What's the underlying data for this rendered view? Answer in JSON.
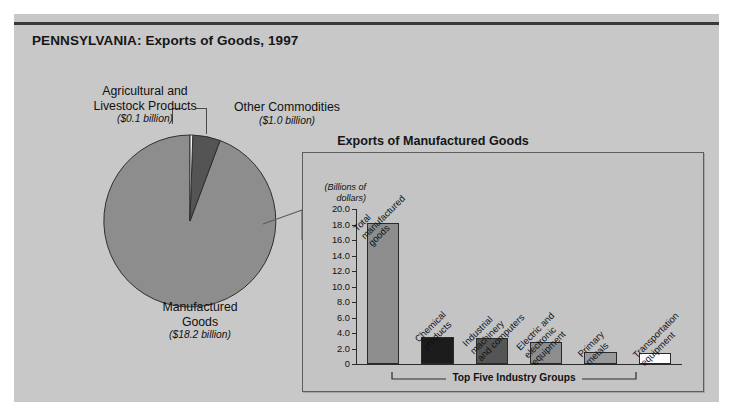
{
  "title": "PENNSYLVANIA: Exports of Goods, 1997",
  "pie_labels": {
    "agricultural": {
      "line1": "Agricultural and",
      "line2": "Livestock Products",
      "amount": "($0.1 billion)"
    },
    "other": {
      "line1": "Other Commodities",
      "line2": "",
      "amount": "($1.0 billion)"
    },
    "manufactured": {
      "line1": "Manufactured",
      "line2": "Goods",
      "amount": "($18.2 billion)"
    }
  },
  "panel": {
    "title": "Exports of Manufactured Goods",
    "axis_caption_line1": "(Billions of",
    "axis_caption_line2": "dollars)",
    "bracket_label": "Top Five Industry Groups"
  },
  "chart_data": [
    {
      "type": "pie",
      "title": "PENNSYLVANIA: Exports of Goods, 1997",
      "unit": "billions of dollars",
      "labels": [
        "Manufactured Goods",
        "Other Commodities",
        "Agricultural and Livestock Products"
      ],
      "values": [
        18.2,
        1.0,
        0.1
      ],
      "value_labels": [
        "($18.2 billion)",
        "($1.0 billion)",
        "($0.1 billion)"
      ],
      "colors": [
        "#8d8d8d",
        "#545454",
        "#f2f2f2"
      ],
      "legend": "none"
    },
    {
      "type": "bar",
      "title": "Exports of Manufactured Goods",
      "xlabel": "",
      "ylabel": "(Billions of dollars)",
      "ylim": [
        0,
        20
      ],
      "yticks": [
        "0",
        "2.0",
        "4.0",
        "6.0",
        "8.0",
        "10.0",
        "12.0",
        "14.0",
        "16.0",
        "18.0",
        "20.0"
      ],
      "grid": false,
      "legend": "none",
      "categories": [
        "Total manufactured goods",
        "Chemical products",
        "Industrial machinery and computers",
        "Electric and electronic equipment",
        "Primary metals",
        "Transportation equipment"
      ],
      "category_lines": [
        [
          "Total",
          "manufactured",
          "goods"
        ],
        [
          "Chemical",
          "products"
        ],
        [
          "Industrial",
          "machinery",
          "and computers"
        ],
        [
          "Electric and",
          "electronic",
          "equipment"
        ],
        [
          "Primary",
          "metals"
        ],
        [
          "Transportation",
          "equipment"
        ]
      ],
      "values": [
        18.2,
        3.5,
        3.4,
        2.8,
        1.5,
        1.4
      ],
      "bar_colors": [
        "#8d8d8d",
        "#1c1c1c",
        "#555555",
        "#8d8d8d",
        "#9a9a9a",
        "#ffffff"
      ],
      "annotation": "Top Five Industry Groups",
      "annotation_covers": [
        1,
        2,
        3,
        4,
        5
      ]
    }
  ]
}
